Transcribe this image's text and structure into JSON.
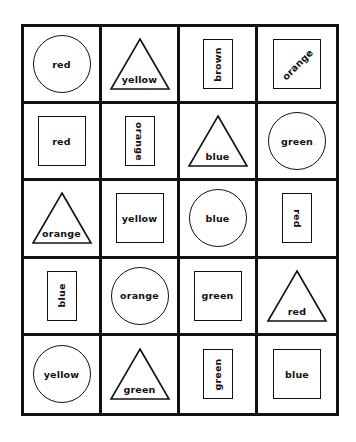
{
  "grid": {
    "rows": 5,
    "cols": 4,
    "cells": [
      [
        {
          "shape": "circle",
          "label": "red",
          "orientation": "horizontal"
        },
        {
          "shape": "triangle",
          "label": "yellow",
          "orientation": "horizontal"
        },
        {
          "shape": "rectangle-vertical",
          "label": "brown",
          "orientation": "rotated-ccw"
        },
        {
          "shape": "square",
          "label": "orange",
          "orientation": "diagonal"
        }
      ],
      [
        {
          "shape": "square",
          "label": "red",
          "orientation": "horizontal"
        },
        {
          "shape": "rectangle-vertical",
          "label": "orange",
          "orientation": "rotated-cw"
        },
        {
          "shape": "triangle",
          "label": "blue",
          "orientation": "horizontal"
        },
        {
          "shape": "circle",
          "label": "green",
          "orientation": "horizontal"
        }
      ],
      [
        {
          "shape": "triangle",
          "label": "orange",
          "orientation": "horizontal"
        },
        {
          "shape": "square",
          "label": "yellow",
          "orientation": "horizontal"
        },
        {
          "shape": "circle",
          "label": "blue",
          "orientation": "horizontal"
        },
        {
          "shape": "rectangle-vertical",
          "label": "red",
          "orientation": "rotated-cw"
        }
      ],
      [
        {
          "shape": "rectangle-vertical",
          "label": "blue",
          "orientation": "rotated-ccw"
        },
        {
          "shape": "circle",
          "label": "orange",
          "orientation": "horizontal"
        },
        {
          "shape": "square",
          "label": "green",
          "orientation": "horizontal"
        },
        {
          "shape": "triangle",
          "label": "red",
          "orientation": "horizontal"
        }
      ],
      [
        {
          "shape": "circle",
          "label": "yellow",
          "orientation": "horizontal"
        },
        {
          "shape": "triangle",
          "label": "green",
          "orientation": "horizontal"
        },
        {
          "shape": "rectangle-vertical",
          "label": "green",
          "orientation": "rotated-ccw"
        },
        {
          "shape": "square",
          "label": "blue",
          "orientation": "horizontal"
        }
      ]
    ]
  },
  "colors": {
    "line": "#111111",
    "background": "#ffffff"
  }
}
